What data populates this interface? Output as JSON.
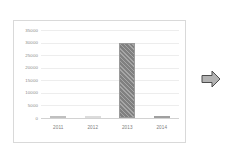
{
  "chart_data": {
    "type": "bar",
    "title": "",
    "subtitle": "",
    "xlabel": "",
    "ylabel": "",
    "categories": [
      "2011",
      "2012",
      "2013",
      "2014"
    ],
    "values": [
      200,
      100,
      30000,
      400
    ],
    "series": [
      {
        "name": "",
        "values": [
          200,
          100,
          30000,
          400
        ]
      }
    ],
    "ylim": [
      0,
      35000
    ],
    "y_ticks": [
      0,
      5000,
      10000,
      15000,
      20000,
      25000,
      30000,
      35000
    ],
    "y_tick_labels": [
      "0",
      "5000",
      "10000",
      "15000",
      "20000",
      "25000",
      "30000",
      "35000"
    ],
    "grid": true,
    "grid_axis": "y",
    "legend": false,
    "legend_position": "none",
    "annotations": []
  },
  "chart": {
    "frame_border_color": "#d9d9d9",
    "plot_background": "#ffffff",
    "gridline_color": "#ededed",
    "baseline_color": "#d2d2d2",
    "bar_color": "#808080",
    "bar_edge_color": "#9a9a9a",
    "tick_label_color": "#8a8a8a",
    "bars": [
      {
        "category": "2011",
        "value": 200,
        "style": "faint"
      },
      {
        "category": "2012",
        "value": 100,
        "style": "very-faint"
      },
      {
        "category": "2013",
        "value": 30000,
        "style": "hatched"
      },
      {
        "category": "2014",
        "value": 400,
        "style": "medium"
      }
    ]
  },
  "decoration": {
    "arrow": {
      "icon": "arrow-right-icon",
      "label": "",
      "fill": "#b3b3b3",
      "stroke": "#4d4d4d",
      "direction": "right"
    }
  }
}
